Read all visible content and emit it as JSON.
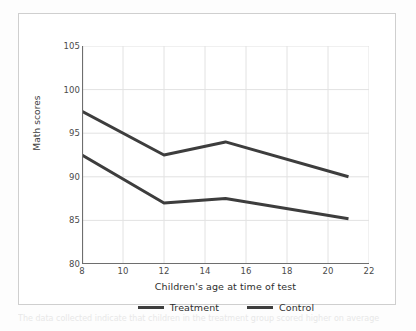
{
  "figure": {
    "bleed_text": "The data collected indicate that children in the treatment group scored higher on average"
  },
  "chart_data": {
    "type": "line",
    "title": "",
    "xlabel": "Children's age at time of test",
    "ylabel": "Math scores",
    "xlim": [
      8,
      22
    ],
    "ylim": [
      80,
      105
    ],
    "xticks": [
      8,
      10,
      12,
      14,
      16,
      18,
      20,
      22
    ],
    "yticks": [
      80,
      85,
      90,
      95,
      100,
      105
    ],
    "grid": true,
    "legend_position": "bottom",
    "series": [
      {
        "name": "Treatment",
        "color": "#3d3d3d",
        "x": [
          8,
          12,
          15,
          21
        ],
        "values": [
          97.5,
          92.5,
          94.0,
          90.0
        ]
      },
      {
        "name": "Control",
        "color": "#3d3d3d",
        "x": [
          8,
          12,
          15,
          21
        ],
        "values": [
          92.5,
          87.0,
          87.5,
          85.2
        ]
      }
    ]
  },
  "style": {
    "grid_color": "#e2e2e2",
    "axis_color": "#6e6e6e",
    "line_color": "#3d3d3d",
    "frame_color": "#cfcfcf",
    "tick_text_color": "#4a4a4a"
  }
}
